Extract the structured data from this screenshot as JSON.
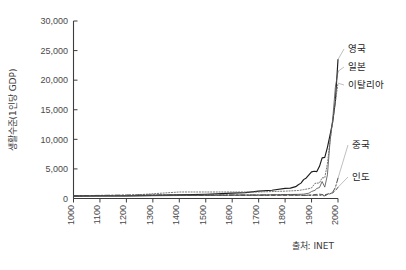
{
  "chart_data": {
    "type": "line",
    "title": "",
    "xlabel": "",
    "ylabel": "생활수준(1인당 GDP)",
    "xlim": [
      1000,
      2000
    ],
    "ylim": [
      0,
      30000
    ],
    "grid": false,
    "legend_position": "right-inline",
    "xticks": [
      "1000",
      "1100",
      "1200",
      "1300",
      "1400",
      "1500",
      "1600",
      "1700",
      "1800",
      "1900",
      "2000"
    ],
    "yticks": [
      "0",
      "5,000",
      "10,000",
      "15,000",
      "20,000",
      "25,000",
      "30,000"
    ],
    "ytick_values": [
      0,
      5000,
      10000,
      15000,
      20000,
      25000,
      30000
    ],
    "xtick_values": [
      1000,
      1100,
      1200,
      1300,
      1400,
      1500,
      1600,
      1700,
      1800,
      1900,
      2000
    ],
    "source": "출처: INET",
    "series": [
      {
        "name": "영국",
        "label": "영국",
        "style": "solid",
        "color": "#1c1c1c",
        "x": [
          1000,
          1100,
          1200,
          1300,
          1400,
          1500,
          1600,
          1650,
          1700,
          1750,
          1800,
          1820,
          1840,
          1850,
          1860,
          1870,
          1880,
          1890,
          1900,
          1910,
          1920,
          1930,
          1940,
          1950,
          1960,
          1970,
          1980,
          1990,
          2000
        ],
        "y": [
          400,
          420,
          450,
          520,
          620,
          720,
          900,
          1000,
          1250,
          1400,
          1700,
          1750,
          2000,
          2330,
          2600,
          3190,
          3480,
          4010,
          4490,
          4610,
          4550,
          5440,
          6860,
          6940,
          8650,
          10770,
          12930,
          16430,
          23500
        ]
      },
      {
        "name": "일본",
        "label": "일본",
        "style": "solid-thin",
        "color": "#555555",
        "x": [
          1000,
          1200,
          1400,
          1500,
          1600,
          1700,
          1800,
          1850,
          1870,
          1890,
          1900,
          1913,
          1920,
          1930,
          1940,
          1950,
          1960,
          1970,
          1980,
          1990,
          2000
        ],
        "y": [
          400,
          420,
          500,
          520,
          560,
          570,
          670,
          700,
          737,
          900,
          1180,
          1390,
          1700,
          1850,
          2870,
          1920,
          3990,
          9710,
          13430,
          18790,
          21500
        ]
      },
      {
        "name": "이탈리아",
        "label": "이탈리아",
        "style": "dotted",
        "color": "#6a6a6a",
        "x": [
          1000,
          1200,
          1400,
          1500,
          1600,
          1700,
          1800,
          1850,
          1870,
          1890,
          1900,
          1913,
          1920,
          1930,
          1940,
          1950,
          1960,
          1970,
          1980,
          1990,
          2000
        ],
        "y": [
          450,
          500,
          1100,
          1100,
          1100,
          1100,
          1240,
          1350,
          1500,
          1670,
          1790,
          2560,
          2590,
          2630,
          3500,
          3500,
          5920,
          9720,
          13150,
          16310,
          19500
        ]
      },
      {
        "name": "중국",
        "label": "중국",
        "style": "dashdot",
        "color": "#3a3a3a",
        "x": [
          1000,
          1200,
          1400,
          1500,
          1600,
          1700,
          1800,
          1850,
          1870,
          1900,
          1913,
          1930,
          1950,
          1960,
          1970,
          1980,
          1990,
          2000
        ],
        "y": [
          450,
          600,
          600,
          600,
          600,
          600,
          600,
          600,
          530,
          545,
          552,
          568,
          448,
          673,
          778,
          1060,
          1860,
          3420
        ]
      },
      {
        "name": "인도",
        "label": "인도",
        "style": "dashed",
        "color": "#4a4a4a",
        "x": [
          1000,
          1200,
          1400,
          1500,
          1600,
          1700,
          1800,
          1850,
          1870,
          1900,
          1913,
          1930,
          1950,
          1960,
          1970,
          1980,
          1990,
          2000
        ],
        "y": [
          450,
          500,
          550,
          550,
          550,
          550,
          533,
          533,
          533,
          599,
          673,
          726,
          619,
          753,
          868,
          938,
          1309,
          1900
        ]
      }
    ]
  },
  "axis": {
    "y_title": "생활수준(1인당 GDP)"
  },
  "source": {
    "text": "출처: INET"
  }
}
